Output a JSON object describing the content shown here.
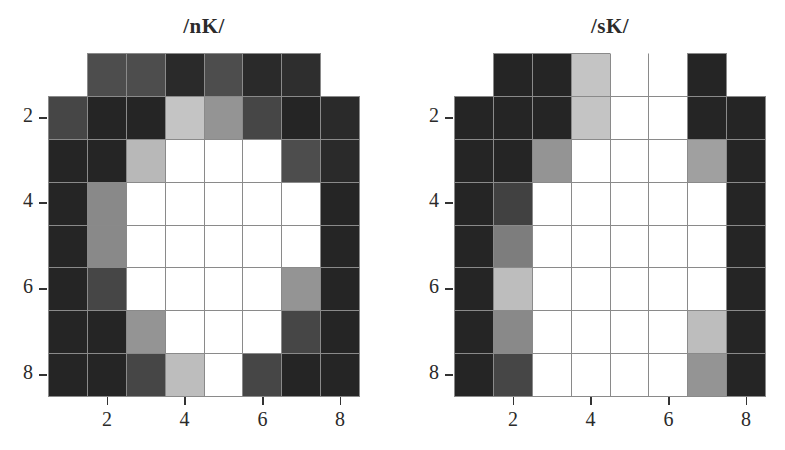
{
  "chart_data": [
    {
      "type": "heatmap",
      "title": "/nK/",
      "xlabel": "",
      "ylabel": "",
      "grid": true,
      "x_ticks": [
        2,
        4,
        6,
        8
      ],
      "y_ticks": [
        2,
        4,
        6,
        8
      ],
      "x_range": [
        1,
        8
      ],
      "y_range": [
        1,
        8
      ],
      "colormap": "grayscale (0 = black, 1 = white)",
      "note": "Row 1 contains only columns 2-7; null = no cell",
      "rows": [
        [
          null,
          0.25,
          0.25,
          0.1,
          0.25,
          0.1,
          0.12,
          null
        ],
        [
          0.22,
          0.08,
          0.08,
          0.75,
          0.55,
          0.22,
          0.08,
          0.1
        ],
        [
          0.08,
          0.08,
          0.7,
          1.0,
          1.0,
          1.0,
          0.25,
          0.1
        ],
        [
          0.08,
          0.5,
          1.0,
          1.0,
          1.0,
          1.0,
          1.0,
          0.08
        ],
        [
          0.08,
          0.5,
          1.0,
          1.0,
          1.0,
          1.0,
          1.0,
          0.08
        ],
        [
          0.08,
          0.22,
          1.0,
          1.0,
          1.0,
          1.0,
          0.55,
          0.08
        ],
        [
          0.08,
          0.08,
          0.55,
          1.0,
          1.0,
          1.0,
          0.22,
          0.08
        ],
        [
          0.08,
          0.08,
          0.22,
          0.72,
          1.0,
          0.22,
          0.08,
          0.08
        ]
      ]
    },
    {
      "type": "heatmap",
      "title": "/sK/",
      "xlabel": "",
      "ylabel": "",
      "grid": true,
      "x_ticks": [
        2,
        4,
        6,
        8
      ],
      "y_ticks": [
        2,
        4,
        6,
        8
      ],
      "x_range": [
        1,
        8
      ],
      "y_range": [
        1,
        8
      ],
      "colormap": "grayscale (0 = black, 1 = white)",
      "note": "Row 1 contains only columns 2-7; null = no cell",
      "rows": [
        [
          null,
          0.08,
          0.08,
          0.75,
          1.0,
          1.0,
          0.08,
          null
        ],
        [
          0.08,
          0.08,
          0.08,
          0.75,
          1.0,
          1.0,
          0.08,
          0.08
        ],
        [
          0.08,
          0.08,
          0.55,
          1.0,
          1.0,
          1.0,
          0.6,
          0.08
        ],
        [
          0.08,
          0.2,
          1.0,
          1.0,
          1.0,
          1.0,
          1.0,
          0.08
        ],
        [
          0.08,
          0.45,
          1.0,
          1.0,
          1.0,
          1.0,
          1.0,
          0.08
        ],
        [
          0.08,
          0.72,
          1.0,
          1.0,
          1.0,
          1.0,
          1.0,
          0.08
        ],
        [
          0.08,
          0.5,
          1.0,
          1.0,
          1.0,
          1.0,
          0.72,
          0.08
        ],
        [
          0.08,
          0.22,
          1.0,
          1.0,
          1.0,
          1.0,
          0.55,
          0.08
        ]
      ]
    }
  ],
  "panels": [
    {
      "title": "/nK/",
      "x_tick_labels": [
        "2",
        "4",
        "6",
        "8"
      ],
      "y_tick_labels": [
        "2",
        "4",
        "6",
        "8"
      ]
    },
    {
      "title": "/sK/",
      "x_tick_labels": [
        "2",
        "4",
        "6",
        "8"
      ],
      "y_tick_labels": [
        "2",
        "4",
        "6",
        "8"
      ]
    }
  ],
  "colors": {
    "gridline": "#8a8a8a",
    "darkest": "#141414",
    "background": "#ffffff"
  }
}
